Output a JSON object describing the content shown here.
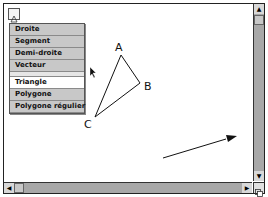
{
  "toolbar": {
    "tool_icon": "triangle-tool-icon"
  },
  "menu": {
    "items": [
      {
        "label": "Droite"
      },
      {
        "label": "Segment"
      },
      {
        "label": "Demi-droite"
      },
      {
        "label": "Vecteur"
      },
      {
        "label": "Triangle",
        "selected": true
      },
      {
        "label": "Polygone"
      },
      {
        "label": "Polygone régulier"
      }
    ]
  },
  "canvas": {
    "points": [
      {
        "label": "A",
        "x": 120,
        "y": 54
      },
      {
        "label": "B",
        "x": 139,
        "y": 82
      },
      {
        "label": "C",
        "x": 94,
        "y": 116
      }
    ],
    "vector": {
      "x1": 162,
      "y1": 157,
      "x2": 228,
      "y2": 136
    }
  },
  "colors": {
    "menu_bg": "#c8c8c8",
    "scroll_bg": "#a8a8a8",
    "stroke": "#111111"
  }
}
